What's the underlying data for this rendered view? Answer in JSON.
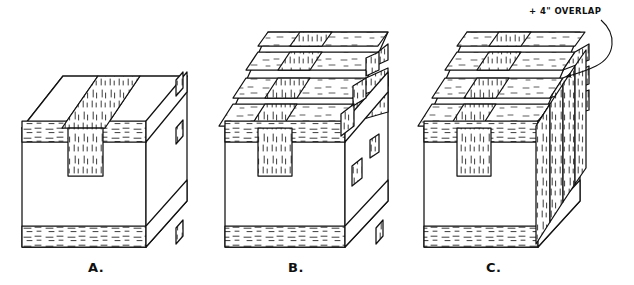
{
  "figure": {
    "background_color": "#ffffff",
    "line_color": "#111111",
    "board_fill": "#ffffff",
    "grain_color": "#3a3a3a",
    "panels": [
      {
        "id": "A",
        "label": "A.",
        "label_x": 88,
        "label_y": 272,
        "description": "Box with a single long-wise strap passing over the top and down the front",
        "cross_board_rows": 1,
        "strap_count": 1,
        "side_overlap": false
      },
      {
        "id": "B",
        "label": "B.",
        "label_x": 288,
        "label_y": 272,
        "description": "Box with basket-weave of four cross boards interlaced with one long-wise strap",
        "cross_board_rows": 4,
        "strap_count": 1,
        "side_overlap": false
      },
      {
        "id": "C",
        "label": "C.",
        "label_x": 486,
        "label_y": 272,
        "description": "Same weave as B with cross boards extended past the side for overlap",
        "cross_board_rows": 4,
        "strap_count": 1,
        "side_overlap": true
      }
    ],
    "annotation": {
      "text": "+ 4\" OVERLAP",
      "text_x": 529,
      "text_y": 14,
      "points_to_panel": "C",
      "leader": "curved line with arrowhead ending at the right side face of panel C"
    }
  }
}
